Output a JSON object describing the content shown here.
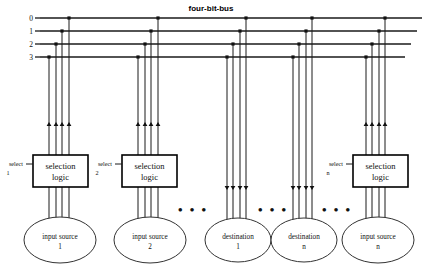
{
  "diagram": {
    "title": "four-bit-bus",
    "bus": {
      "labels": [
        "0",
        "1",
        "2",
        "3"
      ],
      "line_count": 4,
      "y_positions": [
        18,
        31,
        44,
        57
      ],
      "x_start": 40,
      "x_ends": [
        422,
        417,
        411,
        405
      ],
      "label_x": 33
    },
    "groups": [
      {
        "id": "group-input-source-1",
        "kind": "input-source",
        "direction": "up",
        "wire_x": [
          49,
          56,
          62,
          69
        ],
        "arrow_y": 122,
        "box": {
          "label_line1": "selection",
          "label_line2": "logic",
          "x": 33,
          "y": 155,
          "w": 55,
          "h": 32
        },
        "select": {
          "label": "select",
          "index": "1",
          "x": 16,
          "y": 166
        },
        "node": {
          "label_line1": "input source",
          "label_line2": "1",
          "cx": 60,
          "cy": 240,
          "rx": 36,
          "ry": 23
        }
      },
      {
        "id": "group-input-source-2",
        "kind": "input-source",
        "direction": "up",
        "wire_x": [
          138,
          145,
          151,
          158
        ],
        "arrow_y": 122,
        "box": {
          "label_line1": "selection",
          "label_line2": "logic",
          "x": 122,
          "y": 155,
          "w": 55,
          "h": 32
        },
        "select": {
          "label": "select",
          "index": "2",
          "x": 105,
          "y": 166
        },
        "node": {
          "label_line1": "input source",
          "label_line2": "2",
          "cx": 150,
          "cy": 240,
          "rx": 36,
          "ry": 23
        }
      },
      {
        "id": "group-destination-1",
        "kind": "destination",
        "direction": "down",
        "wire_x": [
          227,
          233,
          240,
          246
        ],
        "arrow_y": 190,
        "box": null,
        "select": null,
        "node": {
          "label_line1": "destination",
          "label_line2": "1",
          "cx": 238,
          "cy": 240,
          "rx": 33,
          "ry": 22
        }
      },
      {
        "id": "group-destination-n",
        "kind": "destination",
        "direction": "down",
        "wire_x": [
          293,
          299,
          306,
          312
        ],
        "arrow_y": 190,
        "box": null,
        "select": null,
        "node": {
          "label_line1": "destination",
          "label_line2": "n",
          "cx": 304,
          "cy": 240,
          "rx": 33,
          "ry": 22
        }
      },
      {
        "id": "group-input-source-n",
        "kind": "input-source",
        "direction": "up",
        "wire_x": [
          366,
          372,
          379,
          385
        ],
        "arrow_y": 122,
        "box": {
          "label_line1": "selection",
          "label_line2": "logic",
          "x": 353,
          "y": 155,
          "w": 55,
          "h": 32
        },
        "select": {
          "label": "select",
          "index": "n",
          "x": 336,
          "y": 166
        },
        "node": {
          "label_line1": "input source",
          "label_line2": "n",
          "cx": 378,
          "cy": 240,
          "rx": 36,
          "ry": 23
        }
      }
    ],
    "ellipsis_groups": [
      {
        "id": "ellipsis-1",
        "text": "•  •  •",
        "x": 193,
        "y": 214
      },
      {
        "id": "ellipsis-2",
        "text": "•  •  •",
        "x": 273,
        "y": 214
      },
      {
        "id": "ellipsis-3",
        "text": "•  •  •",
        "x": 337,
        "y": 214
      }
    ]
  }
}
